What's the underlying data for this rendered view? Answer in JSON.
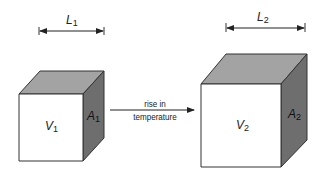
{
  "diagram": {
    "colors": {
      "front_face": "#ffffff",
      "top_face": "#a3a3a3",
      "side_face": "#6e6e6e",
      "stroke": "#333333"
    },
    "cube_before": {
      "length_label": "L",
      "length_sub": "1",
      "volume_label": "V",
      "volume_sub": "1",
      "area_label": "A",
      "area_sub": "1"
    },
    "cube_after": {
      "length_label": "L",
      "length_sub": "2",
      "volume_label": "V",
      "volume_sub": "2",
      "area_label": "A",
      "area_sub": "2"
    },
    "arrow": {
      "label_line1": "rise in",
      "label_line2": "temperature"
    }
  }
}
